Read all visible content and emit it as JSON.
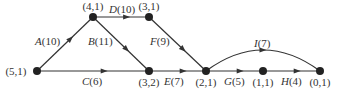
{
  "diagram": {
    "type": "activity-network",
    "nodes": [
      {
        "id": "n51",
        "label": "(5,1)",
        "x": 37,
        "y": 71,
        "lx": 22,
        "ly": 75,
        "anchor": "middle"
      },
      {
        "id": "n41",
        "label": "(4,1)",
        "x": 93,
        "y": 17,
        "lx": 93,
        "ly": 10,
        "anchor": "middle"
      },
      {
        "id": "n31",
        "label": "(3,1)",
        "x": 149,
        "y": 17,
        "lx": 149,
        "ly": 10,
        "anchor": "middle"
      },
      {
        "id": "n32",
        "label": "(3,2)",
        "x": 149,
        "y": 71,
        "lx": 149,
        "ly": 86,
        "anchor": "middle"
      },
      {
        "id": "n21",
        "label": "(2,1)",
        "x": 206,
        "y": 71,
        "lx": 206,
        "ly": 86,
        "anchor": "middle"
      },
      {
        "id": "n11",
        "label": "(1,1)",
        "x": 263,
        "y": 71,
        "lx": 263,
        "ly": 86,
        "anchor": "middle"
      },
      {
        "id": "n01",
        "label": "(0,1)",
        "x": 320,
        "y": 71,
        "lx": 320,
        "ly": 86,
        "anchor": "middle"
      }
    ],
    "edges": [
      {
        "id": "A",
        "name": "A",
        "weight": "(10)",
        "from": "n51",
        "to": "n41",
        "lx": 35,
        "ly": 45
      },
      {
        "id": "B",
        "name": "B",
        "weight": "(11)",
        "from": "n41",
        "to": "n32",
        "lx": 88,
        "ly": 45
      },
      {
        "id": "C",
        "name": "C",
        "weight": "(6)",
        "from": "n51",
        "to": "n32",
        "lx": 82,
        "ly": 85
      },
      {
        "id": "D",
        "name": "D",
        "weight": "(10)",
        "from": "n41",
        "to": "n31",
        "lx": 109,
        "ly": 13
      },
      {
        "id": "E",
        "name": "E",
        "weight": "(7)",
        "from": "n32",
        "to": "n21",
        "lx": 164,
        "ly": 85
      },
      {
        "id": "F",
        "name": "F",
        "weight": "(9)",
        "from": "n31",
        "to": "n21",
        "lx": 150,
        "ly": 45
      },
      {
        "id": "G",
        "name": "G",
        "weight": "(5)",
        "from": "n21",
        "to": "n11",
        "lx": 224,
        "ly": 85
      },
      {
        "id": "H",
        "name": "H",
        "weight": "(4)",
        "from": "n11",
        "to": "n01",
        "lx": 281,
        "ly": 85
      },
      {
        "id": "I",
        "name": "I",
        "weight": "(7)",
        "from": "n21",
        "to": "n01",
        "lx": 254,
        "ly": 47,
        "curved": true
      }
    ]
  }
}
